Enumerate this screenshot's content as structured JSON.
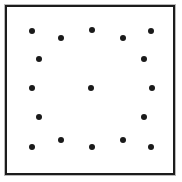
{
  "figure": {
    "title": "Dot pattern inside square frame",
    "background_color": "#ffffff",
    "frame": {
      "border_color": "#1c1c1c",
      "outer_line_color": "#b9b9b9",
      "border_width_px": 2,
      "x": 5,
      "y": 5,
      "width": 170,
      "height": 170
    },
    "dot_color": "#1a1a1a",
    "dot_diameter_px": 6,
    "dot_count": 17
  },
  "chart_data": {
    "type": "scatter",
    "title": "Dot pattern inside square frame",
    "xlabel": "",
    "ylabel": "",
    "xlim": [
      0,
      182
    ],
    "ylim": [
      0,
      182
    ],
    "grid": false,
    "legend": "none",
    "marker": "filled-circle",
    "marker_size_px": 6,
    "marker_color": "#1a1a1a",
    "rows": [
      {
        "name": "row-1-top-zigzag",
        "count": 5
      },
      {
        "name": "row-2-pair",
        "count": 2
      },
      {
        "name": "row-3-triple",
        "count": 3
      },
      {
        "name": "row-4-pair",
        "count": 2
      },
      {
        "name": "row-5-bottom-zigzag",
        "count": 5
      }
    ],
    "points": [
      {
        "id": "p01",
        "row": "row-1-top-zigzag",
        "x": 32,
        "y": 31
      },
      {
        "id": "p02",
        "row": "row-1-top-zigzag",
        "x": 61,
        "y": 38
      },
      {
        "id": "p03",
        "row": "row-1-top-zigzag",
        "x": 92,
        "y": 30
      },
      {
        "id": "p04",
        "row": "row-1-top-zigzag",
        "x": 123,
        "y": 38
      },
      {
        "id": "p05",
        "row": "row-1-top-zigzag",
        "x": 151,
        "y": 31
      },
      {
        "id": "p06",
        "row": "row-2-pair",
        "x": 39,
        "y": 59
      },
      {
        "id": "p07",
        "row": "row-2-pair",
        "x": 144,
        "y": 59
      },
      {
        "id": "p08",
        "row": "row-3-triple",
        "x": 32,
        "y": 88
      },
      {
        "id": "p09",
        "row": "row-3-triple",
        "x": 91,
        "y": 88
      },
      {
        "id": "p10",
        "row": "row-3-triple",
        "x": 152,
        "y": 88
      },
      {
        "id": "p11",
        "row": "row-4-pair",
        "x": 39,
        "y": 117
      },
      {
        "id": "p12",
        "row": "row-4-pair",
        "x": 144,
        "y": 117
      },
      {
        "id": "p13",
        "row": "row-5-bottom-zigzag",
        "x": 32,
        "y": 147
      },
      {
        "id": "p14",
        "row": "row-5-bottom-zigzag",
        "x": 61,
        "y": 140
      },
      {
        "id": "p15",
        "row": "row-5-bottom-zigzag",
        "x": 92,
        "y": 147
      },
      {
        "id": "p16",
        "row": "row-5-bottom-zigzag",
        "x": 123,
        "y": 140
      },
      {
        "id": "p17",
        "row": "row-5-bottom-zigzag",
        "x": 151,
        "y": 147
      }
    ]
  }
}
